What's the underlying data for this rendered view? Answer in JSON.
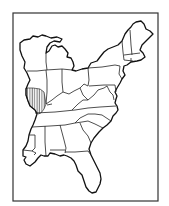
{
  "map": {
    "type": "outline-map",
    "region": "Eastern United States",
    "colors": {
      "background": "#ffffff",
      "outline": "#111111",
      "frame": "#333333",
      "hatch": "#222222"
    },
    "highlighted_region": {
      "name": "southern-illinois",
      "style": "vertical-hatching"
    },
    "states": [
      "Wisconsin",
      "Michigan",
      "Illinois",
      "Indiana",
      "Ohio",
      "Pennsylvania",
      "New York",
      "Vermont",
      "New Hampshire",
      "Maine",
      "Massachusetts",
      "Connecticut",
      "Rhode Island",
      "New Jersey",
      "Delaware",
      "Maryland",
      "West Virginia",
      "Virginia",
      "Kentucky",
      "Tennessee",
      "North Carolina",
      "South Carolina",
      "Georgia",
      "Florida",
      "Alabama",
      "Mississippi",
      "Louisiana"
    ]
  }
}
